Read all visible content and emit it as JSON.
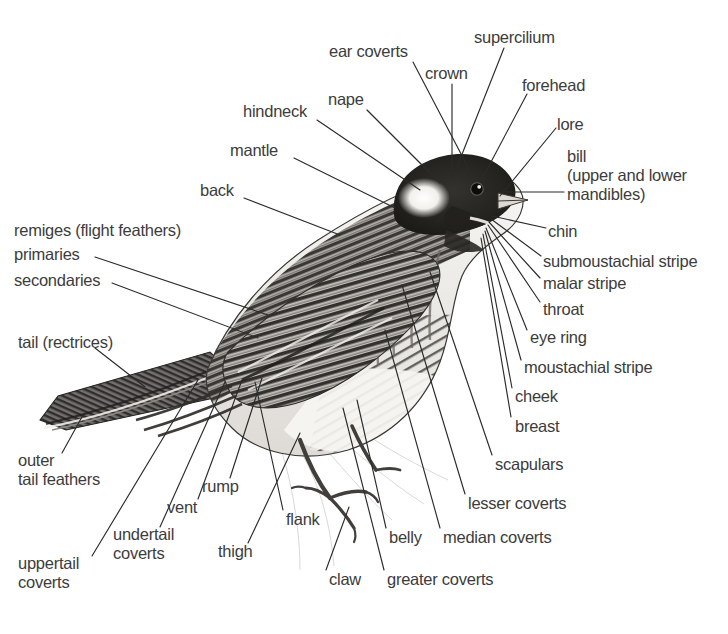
{
  "diagram": {
    "style": "grayscale halftone illustration with leader-line callouts",
    "background_color": "#ffffff",
    "text_color": "#3c3c3c",
    "leader_color": "#2b2b2b",
    "label_count": 33
  },
  "labels": [
    {
      "id": "ear-coverts",
      "text": "ear coverts",
      "x": 329,
      "y": 42,
      "align": "left",
      "leader": [
        [
          413,
          62
        ],
        [
          471,
          173
        ]
      ]
    },
    {
      "id": "supercilium",
      "text": "supercilium",
      "x": 474,
      "y": 28,
      "align": "left",
      "leader": [
        [
          504,
          48
        ],
        [
          455,
          172
        ]
      ]
    },
    {
      "id": "crown",
      "text": "crown",
      "x": 425,
      "y": 64,
      "align": "left",
      "leader": [
        [
          452,
          84
        ],
        [
          452,
          177
        ]
      ]
    },
    {
      "id": "forehead",
      "text": "forehead",
      "x": 522,
      "y": 76,
      "align": "left",
      "leader": [
        [
          527,
          94
        ],
        [
          482,
          179
        ]
      ]
    },
    {
      "id": "nape",
      "text": "nape",
      "x": 328,
      "y": 90,
      "align": "left",
      "leader": [
        [
          367,
          110
        ],
        [
          440,
          183
        ]
      ]
    },
    {
      "id": "lore",
      "text": "lore",
      "x": 557,
      "y": 115,
      "align": "left",
      "leader": [
        [
          556,
          128
        ],
        [
          500,
          196
        ]
      ]
    },
    {
      "id": "hindneck",
      "text": "hindneck",
      "x": 243,
      "y": 102,
      "align": "left",
      "leader": [
        [
          317,
          120
        ],
        [
          420,
          190
        ]
      ]
    },
    {
      "id": "bill",
      "text": "bill\n(upper and lower\nmandibles)",
      "x": 567,
      "y": 147,
      "align": "left",
      "leader": [
        [
          564,
          192
        ],
        [
          505,
          192
        ]
      ]
    },
    {
      "id": "mantle",
      "text": "mantle",
      "x": 230,
      "y": 141,
      "align": "left",
      "leader": [
        [
          294,
          158
        ],
        [
          395,
          208
        ]
      ]
    },
    {
      "id": "chin",
      "text": "chin",
      "x": 548,
      "y": 222,
      "align": "left",
      "leader": [
        [
          546,
          228
        ],
        [
          492,
          216
        ]
      ]
    },
    {
      "id": "back",
      "text": "back",
      "x": 200,
      "y": 181,
      "align": "left",
      "leader": [
        [
          244,
          198
        ],
        [
          340,
          235
        ]
      ]
    },
    {
      "id": "submoustachial-stripe",
      "text": "submoustachial stripe",
      "x": 543,
      "y": 252,
      "align": "left",
      "leader": [
        [
          541,
          256
        ],
        [
          491,
          219
        ]
      ]
    },
    {
      "id": "remiges",
      "text": "remiges (flight feathers)",
      "x": 14,
      "y": 221,
      "align": "left",
      "leader": null
    },
    {
      "id": "primaries",
      "text": "primaries",
      "x": 14,
      "y": 245,
      "align": "left",
      "leader": [
        [
          95,
          257
        ],
        [
          268,
          315
        ]
      ]
    },
    {
      "id": "malar-stripe",
      "text": "malar stripe",
      "x": 543,
      "y": 274,
      "align": "left",
      "leader": [
        [
          540,
          278
        ],
        [
          489,
          222
        ]
      ]
    },
    {
      "id": "secondaries",
      "text": "secondaries",
      "x": 14,
      "y": 271,
      "align": "left",
      "leader": [
        [
          112,
          283
        ],
        [
          258,
          338
        ]
      ]
    },
    {
      "id": "throat",
      "text": "throat",
      "x": 543,
      "y": 300,
      "align": "left",
      "leader": [
        [
          540,
          302
        ],
        [
          488,
          225
        ]
      ]
    },
    {
      "id": "eye-ring",
      "text": "eye ring",
      "x": 530,
      "y": 328,
      "align": "left",
      "leader": [
        [
          527,
          330
        ],
        [
          486,
          228
        ]
      ]
    },
    {
      "id": "tail-rectrices",
      "text": "tail (rectrices)",
      "x": 18,
      "y": 333,
      "align": "left",
      "leader": [
        [
          95,
          348
        ],
        [
          145,
          387
        ]
      ]
    },
    {
      "id": "moustachial-stripe",
      "text": "moustachial stripe",
      "x": 524,
      "y": 358,
      "align": "left",
      "leader": [
        [
          521,
          360
        ],
        [
          485,
          231
        ]
      ]
    },
    {
      "id": "cheek",
      "text": "cheek",
      "x": 515,
      "y": 387,
      "align": "left",
      "leader": [
        [
          512,
          388
        ],
        [
          483,
          234
        ]
      ]
    },
    {
      "id": "breast",
      "text": "breast",
      "x": 515,
      "y": 417,
      "align": "left",
      "leader": [
        [
          511,
          417
        ],
        [
          481,
          238
        ]
      ]
    },
    {
      "id": "outer-tail-feathers",
      "text": "outer\ntail feathers",
      "x": 18,
      "y": 451,
      "align": "left",
      "leader": [
        [
          62,
          453
        ],
        [
          83,
          415
        ]
      ]
    },
    {
      "id": "scapulars",
      "text": "scapulars",
      "x": 495,
      "y": 455,
      "align": "left",
      "leader": [
        [
          492,
          455
        ],
        [
          430,
          272
        ]
      ]
    },
    {
      "id": "rump",
      "text": "rump",
      "x": 202,
      "y": 477,
      "align": "left",
      "leader": [
        [
          230,
          478
        ],
        [
          262,
          378
        ]
      ]
    },
    {
      "id": "vent",
      "text": "vent",
      "x": 167,
      "y": 498,
      "align": "left",
      "leader": [
        [
          198,
          499
        ],
        [
          242,
          380
        ]
      ]
    },
    {
      "id": "lesser-coverts",
      "text": "lesser coverts",
      "x": 468,
      "y": 494,
      "align": "left",
      "leader": [
        [
          465,
          494
        ],
        [
          402,
          285
        ]
      ]
    },
    {
      "id": "flank",
      "text": "flank",
      "x": 286,
      "y": 510,
      "align": "left",
      "leader": [
        [
          283,
          510
        ],
        [
          255,
          382
        ]
      ]
    },
    {
      "id": "undertail-coverts",
      "text": "undertail\ncoverts",
      "x": 113,
      "y": 525,
      "align": "left",
      "leader": [
        [
          160,
          527
        ],
        [
          225,
          382
        ]
      ]
    },
    {
      "id": "belly",
      "text": "belly",
      "x": 389,
      "y": 528,
      "align": "left",
      "leader": [
        [
          386,
          528
        ],
        [
          357,
          400
        ]
      ]
    },
    {
      "id": "median-coverts",
      "text": "median coverts",
      "x": 443,
      "y": 528,
      "align": "left",
      "leader": [
        [
          440,
          528
        ],
        [
          385,
          330
        ]
      ]
    },
    {
      "id": "thigh",
      "text": "thigh",
      "x": 218,
      "y": 542,
      "align": "left",
      "leader": [
        [
          248,
          543
        ],
        [
          300,
          433
        ]
      ]
    },
    {
      "id": "uppertail-coverts",
      "text": "uppertail\ncoverts",
      "x": 18,
      "y": 554,
      "align": "left",
      "leader": [
        [
          92,
          556
        ],
        [
          198,
          380
        ]
      ]
    },
    {
      "id": "claw",
      "text": "claw",
      "x": 329,
      "y": 570,
      "align": "left",
      "leader": [
        [
          326,
          570
        ],
        [
          349,
          507
        ]
      ]
    },
    {
      "id": "greater-coverts",
      "text": "greater coverts",
      "x": 387,
      "y": 570,
      "align": "left",
      "leader": [
        [
          384,
          570
        ],
        [
          343,
          408
        ]
      ]
    }
  ]
}
